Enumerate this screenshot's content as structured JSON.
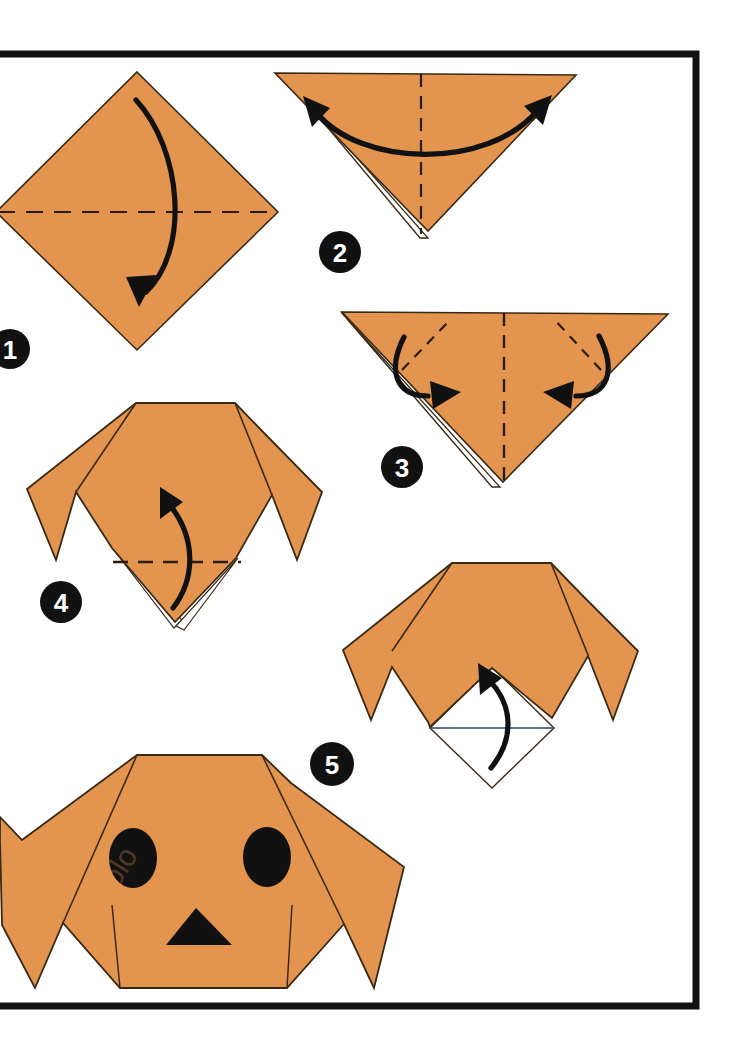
{
  "page": {
    "background_color": "#ffffff",
    "width": 736,
    "height": 1046
  },
  "frame": {
    "name": "page-border-frame",
    "color": "#111111",
    "stroke_width": 7,
    "x": -20,
    "y": 54,
    "width": 716,
    "height": 952
  },
  "palette": {
    "paper_front": "#E3954F",
    "paper_back": "#FFFFFF",
    "paper_edge": "#3A2A14",
    "fold_line": "#2B1C08",
    "arrow": "#111111",
    "badge_fill": "#111111",
    "badge_label": "#FFFFFF",
    "eye_fill": "#111111",
    "nose_fill": "#111111"
  },
  "steps": [
    {
      "number": "1",
      "badge_cx": 10,
      "badge_cy": 349,
      "shape": "square-diamond",
      "caption": "Fold the square diamond in half downward along the horizontal crease",
      "fold_lines": [
        "horizontal-valley-dashed"
      ],
      "arrows": [
        "curved-down-arrow"
      ]
    },
    {
      "number": "2",
      "badge_cx": 340,
      "badge_cy": 252,
      "shape": "down-triangle",
      "caption": "Crease the triangle in half vertically, then open out to both sides",
      "fold_lines": [
        "vertical-center-dashed"
      ],
      "arrows": [
        "double-headed-curved-arrow"
      ]
    },
    {
      "number": "3",
      "badge_cx": 402,
      "badge_cy": 467,
      "shape": "down-triangle",
      "caption": "Fold both outer corners down along the diagonal creases to form the ears",
      "fold_lines": [
        "vertical-center-dashed",
        "left-diagonal-dashed",
        "right-diagonal-dashed"
      ],
      "arrows": [
        "curved-arrow-left-inward",
        "curved-arrow-right-inward"
      ]
    },
    {
      "number": "4",
      "badge_cx": 61,
      "badge_cy": 602,
      "shape": "dog-head-with-ears",
      "caption": "Fold the bottom point up along the horizontal crease",
      "fold_lines": [
        "horizontal-valley-dashed"
      ],
      "arrows": [
        "curved-up-arrow"
      ]
    },
    {
      "number": "5",
      "badge_cx": 332,
      "badge_cy": 764,
      "shape": "dog-head-with-white-snout",
      "caption": "Fold the white snout flap up to finish the muzzle",
      "fold_lines": [
        "horizontal-solid-line"
      ],
      "arrows": [
        "curved-up-arrow"
      ]
    },
    {
      "number": "",
      "badge_cx": null,
      "badge_cy": null,
      "shape": "finished-dog-face",
      "caption": "Finished origami dog head with eyes and nose",
      "fold_lines": [],
      "arrows": [],
      "features": [
        "left-eye",
        "right-eye",
        "nose"
      ]
    }
  ],
  "watermark": {
    "text": "olo",
    "opacity": 0.18
  }
}
